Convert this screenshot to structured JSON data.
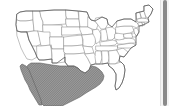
{
  "map": {
    "title": "United States map",
    "projection": "albers-usa-approx",
    "background_color": "#ffffff",
    "state_fill_color": "#ffffff",
    "state_border_color": "#8e8e8e",
    "country_outline_color": "#5a5a5a",
    "highlight": {
      "name": "Mexico",
      "fill_color": "#9a9a9a",
      "hatch_color": "#5f5f5f",
      "pattern": "diagonal-hatch",
      "position": "southwest-lower-left"
    },
    "regions": [
      {
        "name": "washington",
        "label": "WA"
      },
      {
        "name": "oregon",
        "label": "OR"
      },
      {
        "name": "california",
        "label": "CA"
      },
      {
        "name": "idaho",
        "label": "ID"
      },
      {
        "name": "nevada",
        "label": "NV"
      },
      {
        "name": "montana",
        "label": "MT"
      },
      {
        "name": "wyoming",
        "label": "WY"
      },
      {
        "name": "utah",
        "label": "UT"
      },
      {
        "name": "arizona",
        "label": "AZ"
      },
      {
        "name": "colorado",
        "label": "CO"
      },
      {
        "name": "new-mexico",
        "label": "NM"
      },
      {
        "name": "north-dakota",
        "label": "ND"
      },
      {
        "name": "south-dakota",
        "label": "SD"
      },
      {
        "name": "nebraska",
        "label": "NE"
      },
      {
        "name": "kansas",
        "label": "KS"
      },
      {
        "name": "oklahoma",
        "label": "OK"
      },
      {
        "name": "texas",
        "label": "TX"
      },
      {
        "name": "minnesota",
        "label": "MN"
      },
      {
        "name": "iowa",
        "label": "IA"
      },
      {
        "name": "missouri",
        "label": "MO"
      },
      {
        "name": "arkansas",
        "label": "AR"
      },
      {
        "name": "louisiana",
        "label": "LA"
      },
      {
        "name": "wisconsin",
        "label": "WI"
      },
      {
        "name": "illinois",
        "label": "IL"
      },
      {
        "name": "michigan",
        "label": "MI"
      },
      {
        "name": "indiana",
        "label": "IN"
      },
      {
        "name": "ohio",
        "label": "OH"
      },
      {
        "name": "kentucky",
        "label": "KY"
      },
      {
        "name": "tennessee",
        "label": "TN"
      },
      {
        "name": "mississippi",
        "label": "MS"
      },
      {
        "name": "alabama",
        "label": "AL"
      },
      {
        "name": "georgia",
        "label": "GA"
      },
      {
        "name": "florida",
        "label": "FL"
      },
      {
        "name": "south-carolina",
        "label": "SC"
      },
      {
        "name": "north-carolina",
        "label": "NC"
      },
      {
        "name": "virginia",
        "label": "VA"
      },
      {
        "name": "west-virginia",
        "label": "WV"
      },
      {
        "name": "maryland",
        "label": "MD"
      },
      {
        "name": "delaware",
        "label": "DE"
      },
      {
        "name": "pennsylvania",
        "label": "PA"
      },
      {
        "name": "new-jersey",
        "label": "NJ"
      },
      {
        "name": "new-york",
        "label": "NY"
      },
      {
        "name": "connecticut",
        "label": "CT"
      },
      {
        "name": "rhode-island",
        "label": "RI"
      },
      {
        "name": "massachusetts",
        "label": "MA"
      },
      {
        "name": "vermont",
        "label": "VT"
      },
      {
        "name": "new-hampshire",
        "label": "NH"
      },
      {
        "name": "maine",
        "label": "ME"
      }
    ]
  },
  "scrollbar": {
    "orientation": "vertical",
    "position": "right",
    "thumb_color": "#8a8a8a",
    "track_color": "#f4f4f4"
  }
}
